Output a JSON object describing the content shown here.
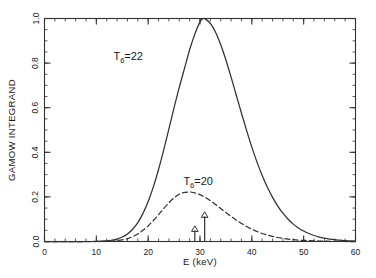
{
  "figure": {
    "background": "#ffffff",
    "frame_color": "#303030",
    "curve_color": "#303030"
  },
  "chart_data": {
    "type": "line",
    "title": "",
    "xlabel": "E (keV)",
    "ylabel": "GAMOW INTEGRAND",
    "xlim": [
      0,
      60
    ],
    "ylim": [
      0.0,
      1.0
    ],
    "grid": false,
    "legend_position": "inline-annotation",
    "x_major_ticks": [
      0,
      10,
      20,
      30,
      40,
      50,
      60
    ],
    "x_major_tick_labels": [
      "0",
      "10",
      "20",
      "30",
      "40",
      "50",
      "60"
    ],
    "x_minor_tick_step": 2,
    "y_major_ticks": [
      0.0,
      0.2,
      0.4,
      0.6,
      0.8,
      1.0
    ],
    "y_major_tick_labels": [
      "0.0",
      "0.2",
      "0.4",
      "0.6",
      "0.8",
      "1.0"
    ],
    "y_minor_tick_step": 0.05,
    "series": [
      {
        "name": "T6=22",
        "label_text": "T",
        "label_sub": "6",
        "label_rest": "=22",
        "style": "solid",
        "peak_x": 30.6,
        "peak_y": 1.0,
        "width_sigma": 7.0,
        "x": [
          0,
          2,
          4,
          6,
          8,
          10,
          12,
          13,
          14,
          15,
          16,
          17,
          18,
          19,
          20,
          21,
          22,
          23,
          24,
          25,
          26,
          27,
          28,
          29,
          30,
          30.6,
          31,
          32,
          33,
          34,
          35,
          36,
          37,
          38,
          39,
          40,
          41,
          42,
          43,
          44,
          45,
          46,
          47,
          48,
          49,
          50,
          51,
          52,
          53,
          54,
          55,
          56,
          57,
          58,
          59,
          60
        ],
        "y": [
          0.0,
          0.0,
          0.0,
          0.0,
          0.0,
          0.001,
          0.003,
          0.006,
          0.011,
          0.02,
          0.034,
          0.055,
          0.085,
          0.126,
          0.179,
          0.245,
          0.323,
          0.411,
          0.505,
          0.6,
          0.691,
          0.775,
          0.86,
          0.93,
          0.985,
          1.0,
          0.998,
          0.978,
          0.938,
          0.882,
          0.814,
          0.737,
          0.656,
          0.575,
          0.497,
          0.423,
          0.356,
          0.296,
          0.243,
          0.198,
          0.159,
          0.127,
          0.1,
          0.078,
          0.061,
          0.047,
          0.036,
          0.027,
          0.02,
          0.015,
          0.011,
          0.008,
          0.006,
          0.004,
          0.003,
          0.002
        ]
      },
      {
        "name": "T6=20",
        "label_text": "T",
        "label_sub": "6",
        "label_rest": "=20",
        "style": "dashed",
        "peak_x": 28.2,
        "peak_y": 0.222,
        "width_sigma": 6.4,
        "x": [
          0,
          2,
          4,
          6,
          8,
          10,
          12,
          13,
          14,
          15,
          16,
          17,
          18,
          19,
          20,
          21,
          22,
          23,
          24,
          25,
          26,
          27,
          28,
          28.2,
          29,
          30,
          31,
          32,
          33,
          34,
          35,
          36,
          37,
          38,
          39,
          40,
          41,
          42,
          43,
          44,
          45,
          46,
          47,
          48,
          49,
          50,
          51,
          52,
          53,
          54,
          55,
          56,
          57,
          58,
          59,
          60
        ],
        "y": [
          0.0,
          0.0,
          0.0,
          0.0,
          0.0,
          0.0,
          0.001,
          0.002,
          0.004,
          0.007,
          0.013,
          0.022,
          0.034,
          0.05,
          0.07,
          0.094,
          0.12,
          0.148,
          0.174,
          0.196,
          0.212,
          0.22,
          0.222,
          0.222,
          0.218,
          0.21,
          0.198,
          0.183,
          0.166,
          0.148,
          0.13,
          0.112,
          0.096,
          0.081,
          0.067,
          0.055,
          0.045,
          0.036,
          0.029,
          0.023,
          0.018,
          0.014,
          0.011,
          0.008,
          0.006,
          0.005,
          0.004,
          0.003,
          0.002,
          0.002,
          0.001,
          0.001,
          0.001,
          0.0,
          0.0,
          0.0
        ]
      }
    ],
    "annotations": [
      {
        "name": "label-t6-22",
        "text": "T",
        "sub": "6",
        "rest": "=22",
        "x": 19.0,
        "y": 0.815
      },
      {
        "name": "label-t6-20",
        "text": "T",
        "sub": "6",
        "rest": "=20",
        "x": 32.5,
        "y": 0.255
      },
      {
        "name": "arrow-marker-low",
        "kind": "arrow",
        "x": 29.0,
        "height": 0.065
      },
      {
        "name": "arrow-marker-high",
        "kind": "arrow",
        "x": 30.9,
        "height": 0.128
      }
    ]
  }
}
